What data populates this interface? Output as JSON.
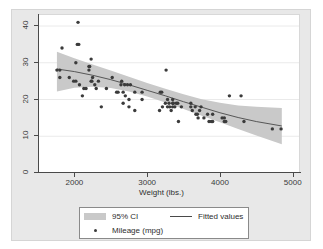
{
  "chart_data": {
    "type": "scatter",
    "title": "",
    "subtitle": "",
    "xlabel": "Weight (lbs.)",
    "ylabel": "",
    "xlim": [
      1500,
      5100
    ],
    "ylim": [
      0,
      43
    ],
    "xticks": [
      2000,
      3000,
      4000,
      5000
    ],
    "yticks": [
      0,
      10,
      20,
      30,
      40
    ],
    "xtick_labels": [
      "2000",
      "3000",
      "4000",
      "5000"
    ],
    "ytick_labels": [
      "0",
      "10",
      "20",
      "30",
      "40"
    ],
    "grid": "horizontal",
    "legend_position": "bottom",
    "legend": [
      {
        "key": "ci",
        "label": "95% CI",
        "marker": "band",
        "color": "#c9c9c9"
      },
      {
        "key": "fit",
        "label": "Fitted values",
        "marker": "line",
        "color": "#4a4a4a"
      },
      {
        "key": "points",
        "label": "Mileage (mpg)",
        "marker": "circle",
        "color": "#3b3b3b"
      }
    ],
    "series": [
      {
        "name": "Mileage (mpg)",
        "type": "scatter",
        "marker": "circle",
        "color": "#3b3b3b",
        "x": [
          1760,
          1800,
          1800,
          1830,
          1930,
          1990,
          2020,
          2020,
          2040,
          2050,
          2060,
          2070,
          2110,
          2130,
          2160,
          2200,
          2200,
          2210,
          2230,
          2230,
          2240,
          2250,
          2280,
          2300,
          2330,
          2370,
          2440,
          2520,
          2580,
          2600,
          2640,
          2650,
          2670,
          2670,
          2690,
          2700,
          2730,
          2750,
          2750,
          2770,
          2830,
          2830,
          2930,
          2930,
          3170,
          3180,
          3200,
          3210,
          3250,
          3260,
          3280,
          3280,
          3300,
          3310,
          3330,
          3350,
          3350,
          3350,
          3360,
          3380,
          3400,
          3420,
          3430,
          3470,
          3600,
          3600,
          3620,
          3660,
          3670,
          3690,
          3700,
          3720,
          3740,
          3780,
          3830,
          3850,
          3880,
          3900,
          3900,
          4030,
          4060,
          4060,
          4080,
          4130,
          4290,
          4330,
          4720,
          4840
        ],
        "y": [
          28,
          28,
          26,
          34,
          26,
          25,
          25,
          30,
          35,
          41,
          35,
          24,
          21,
          23,
          23,
          28,
          29,
          29,
          31,
          25,
          25,
          26,
          24,
          23,
          25,
          18,
          23,
          26,
          22,
          22,
          24,
          25,
          22,
          19,
          24,
          21,
          24,
          20,
          18,
          24,
          22,
          17,
          22,
          20,
          17,
          22,
          22,
          18,
          19,
          28,
          18,
          20,
          19,
          18,
          17,
          18,
          19,
          20,
          19,
          18,
          19,
          19,
          14,
          18,
          18,
          19,
          17,
          18,
          16,
          16,
          15,
          17,
          18,
          15,
          16,
          14,
          14,
          14,
          16,
          15,
          14,
          15,
          14,
          21,
          21,
          14,
          12,
          12
        ]
      },
      {
        "name": "Fitted values",
        "type": "line",
        "color": "#4a4a4a",
        "x": [
          1760,
          2000,
          2250,
          2500,
          2750,
          3000,
          3250,
          3500,
          3750,
          4000,
          4250,
          4500,
          4850
        ],
        "y": [
          28.3,
          27.6,
          26.6,
          25.4,
          24.0,
          22.5,
          21.0,
          19.4,
          17.9,
          16.4,
          15.1,
          14.0,
          12.8
        ]
      },
      {
        "name": "95% CI",
        "type": "band",
        "color": "#c9c9c9",
        "x": [
          1760,
          2000,
          2250,
          2500,
          2750,
          3000,
          3250,
          3500,
          3750,
          4000,
          4250,
          4500,
          4850
        ],
        "upper": [
          33.0,
          31.2,
          29.5,
          27.9,
          26.2,
          24.5,
          22.9,
          21.4,
          20.1,
          19.1,
          18.4,
          18.0,
          17.7
        ],
        "lower": [
          22.2,
          23.2,
          23.5,
          23.1,
          22.2,
          20.8,
          19.2,
          17.4,
          15.6,
          13.8,
          12.0,
          10.2,
          7.8
        ]
      }
    ]
  },
  "axes": {
    "x_title": "Weight (lbs.)",
    "y_title": ""
  },
  "legend": {
    "ci_label": "95% CI",
    "fitted_label": "Fitted values",
    "points_label": "Mileage (mpg)"
  },
  "colors": {
    "band": "#c9c9c9",
    "line": "#4a4a4a",
    "marker": "#3b3b3b",
    "graph_region": "#e8e8e8",
    "plot_background": "#ffffff",
    "gridline": "#eaeaea",
    "axis": "#4a4a4a"
  }
}
